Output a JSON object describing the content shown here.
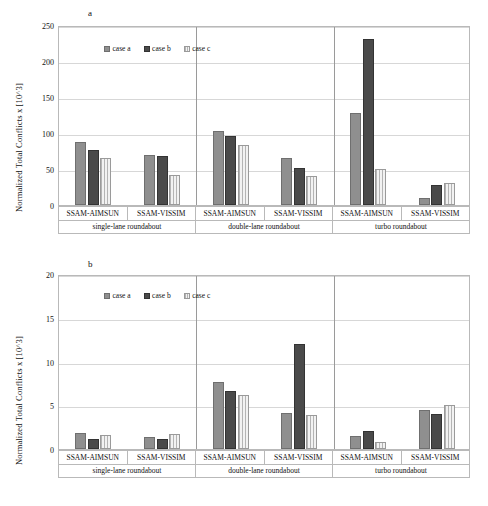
{
  "figure": {
    "panels": [
      {
        "letter": "a",
        "ylabel": "Normalized Total Conflicts  x [10^3]",
        "legend": [
          {
            "label": "case a",
            "key": "case-a"
          },
          {
            "label": "case b",
            "key": "case-b"
          },
          {
            "label": "case c",
            "key": "case-c"
          }
        ]
      },
      {
        "letter": "b",
        "ylabel": "Normalized Total Conflicts  x [10^3]",
        "legend": [
          {
            "label": "case a",
            "key": "case-a"
          },
          {
            "label": "case b",
            "key": "case-b"
          },
          {
            "label": "case c",
            "key": "case-c"
          }
        ]
      }
    ]
  },
  "chart_data": [
    {
      "type": "bar",
      "panel": "a",
      "title": "",
      "xlabel": "",
      "ylabel": "Normalized Total Conflicts  x [10^3]",
      "ylim": [
        0,
        250
      ],
      "yticks": [
        0,
        50,
        100,
        150,
        200,
        250
      ],
      "grid": true,
      "legend_position": "top-left-inside",
      "groups": [
        "single-lane roundabout",
        "double-lane roundabout",
        "turbo roundabout"
      ],
      "categories": [
        "SSAM-AIMSUN",
        "SSAM-VISSIM",
        "SSAM-AIMSUN",
        "SSAM-VISSIM",
        "SSAM-AIMSUN",
        "SSAM-VISSIM"
      ],
      "series": [
        {
          "name": "case a",
          "values": [
            88,
            70,
            103,
            65,
            128,
            10
          ]
        },
        {
          "name": "case b",
          "values": [
            77,
            68,
            96,
            51,
            230,
            28
          ]
        },
        {
          "name": "case c",
          "values": [
            65,
            42,
            83,
            40,
            50,
            31
          ]
        }
      ]
    },
    {
      "type": "bar",
      "panel": "b",
      "title": "",
      "xlabel": "",
      "ylabel": "Normalized Total Conflicts  x [10^3]",
      "ylim": [
        0,
        20
      ],
      "yticks": [
        0,
        5,
        10,
        15,
        20
      ],
      "grid": true,
      "legend_position": "top-left-inside",
      "groups": [
        "single-lane roundabout",
        "double-lane roundabout",
        "turbo roundabout"
      ],
      "categories": [
        "SSAM-AIMSUN",
        "SSAM-VISSIM",
        "SSAM-AIMSUN",
        "SSAM-VISSIM",
        "SSAM-AIMSUN",
        "SSAM-VISSIM"
      ],
      "series": [
        {
          "name": "case a",
          "values": [
            1.8,
            1.4,
            7.7,
            4.1,
            1.5,
            4.5
          ]
        },
        {
          "name": "case b",
          "values": [
            1.1,
            1.2,
            6.6,
            12.0,
            2.1,
            4.0
          ]
        },
        {
          "name": "case c",
          "values": [
            1.6,
            1.7,
            6.2,
            3.9,
            0.8,
            5.0
          ]
        }
      ]
    }
  ],
  "axis_labels": {
    "simulators": [
      "SSAM-AIMSUN",
      "SSAM-VISSIM",
      "SSAM-AIMSUN",
      "SSAM-VISSIM",
      "SSAM-AIMSUN",
      "SSAM-VISSIM"
    ],
    "roundabouts": [
      "single-lane roundabout",
      "double-lane roundabout",
      "turbo roundabout"
    ]
  }
}
